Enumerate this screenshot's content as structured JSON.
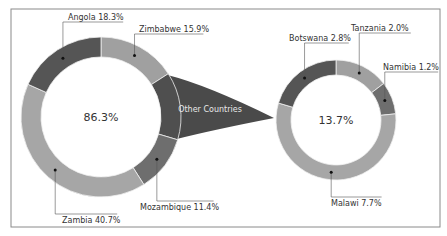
{
  "chart_data": {
    "type": "pie",
    "subtype": "pie-of-pie (donut)",
    "title": "",
    "main": {
      "center_label": "86.3%",
      "slices": [
        {
          "name": "Zimbabwe",
          "value": 15.9,
          "label": "Zimbabwe 15.9%",
          "color": "#a0a0a0"
        },
        {
          "name": "Other Countries",
          "value": 13.7,
          "label": "Other Countries",
          "color": "#4f4f4f"
        },
        {
          "name": "Mozambique",
          "value": 11.4,
          "label": "Mozambique 11.4%",
          "color": "#6e6e6e"
        },
        {
          "name": "Zambia",
          "value": 40.7,
          "label": "Zambia 40.7%",
          "color": "#a6a6a6"
        },
        {
          "name": "Angola",
          "value": 18.3,
          "label": "Angola 18.3%",
          "color": "#555555"
        }
      ]
    },
    "secondary": {
      "center_label": "13.7%",
      "slices": [
        {
          "name": "Tanzania",
          "value": 2.0,
          "label": "Tanzania 2.0%",
          "color": "#a0a0a0"
        },
        {
          "name": "Namibia",
          "value": 1.2,
          "label": "Namibia 1.2%",
          "color": "#6e6e6e"
        },
        {
          "name": "Malawi",
          "value": 7.7,
          "label": "Malawi 7.7%",
          "color": "#a6a6a6"
        },
        {
          "name": "Botswana",
          "value": 2.8,
          "label": "Botswana 2.8%",
          "color": "#555555"
        }
      ]
    },
    "connector_label": "Other Countries",
    "colors": {
      "frame": "#8a8a8a",
      "text": "#333333",
      "connector": "#4a4a4a",
      "separator": "#f0f0f0"
    }
  }
}
